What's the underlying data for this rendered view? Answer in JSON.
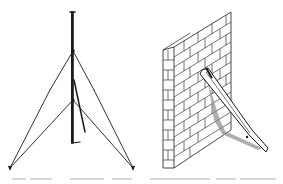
{
  "figure": {
    "panels": [
      {
        "id": "left",
        "subject": "mast-with-guy-wires"
      },
      {
        "id": "right",
        "subject": "brick-wall-with-diagonal-strut"
      }
    ],
    "colors": {
      "ink": "#1a1a1a",
      "shade": "#8c8c8c",
      "background": "#ffffff"
    }
  },
  "caption": {
    "text": "",
    "legible": false
  }
}
